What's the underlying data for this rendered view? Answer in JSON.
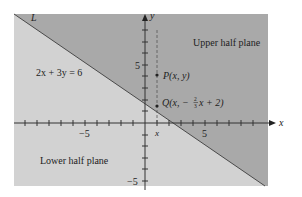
{
  "diagram": {
    "line_label": "L",
    "equation": "2x + 3y = 6",
    "upper_region": "Upper half plane",
    "lower_region": "Lower half plane",
    "point_p": "P(x, y)",
    "point_q_prefix": "Q(x, −",
    "point_q_num": "2",
    "point_q_den": "3",
    "point_q_suffix": "x + 2)",
    "x_axis_label": "x",
    "y_axis_label": "y",
    "x_marker": "x",
    "tick_pos5_x": "5",
    "tick_neg5_x": "−5",
    "tick_pos5_y": "5",
    "tick_neg5_y": "−5",
    "colors": {
      "upper": "#a9a9a9",
      "lower": "#d2d2d2",
      "line": "#4a4a4a",
      "axis": "#333333"
    }
  }
}
